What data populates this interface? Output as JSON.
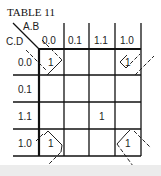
{
  "title": "TABLE 11",
  "row_variables": "C.D",
  "col_variables": "A.B",
  "columns": [
    "0.0",
    "0.1",
    "1.1",
    "1.0"
  ],
  "rows": [
    "0.0",
    "0.1",
    "1.1",
    "1.0"
  ],
  "cells": [
    [
      "1",
      "",
      "",
      "1"
    ],
    [
      "",
      "",
      "",
      ""
    ],
    [
      "",
      "",
      "1",
      ""
    ],
    [
      "1",
      "",
      "",
      "1"
    ]
  ],
  "groupings": [
    {
      "name": "corner-group",
      "cells": [
        [
          0,
          0
        ],
        [
          0,
          3
        ],
        [
          3,
          0
        ],
        [
          3,
          3
        ]
      ],
      "style": "dashed wrap-around loops"
    }
  ]
}
